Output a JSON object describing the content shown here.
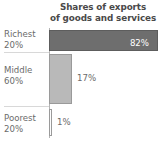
{
  "chart_data": {
    "type": "bar",
    "orientation": "horizontal",
    "title": "Shares of exports of goods and services",
    "title_lines": [
      "Shares of exports",
      "of goods and services"
    ],
    "xlabel": "",
    "ylabel": "",
    "grid": false,
    "legend": null,
    "xlim": [
      0,
      82
    ],
    "categories": [
      "Richest 20%",
      "Middle 60%",
      "Poorest 20%"
    ],
    "category_lines": [
      {
        "line1": "Richest",
        "line2": "20%"
      },
      {
        "line1": "Middle",
        "line2": "60%"
      },
      {
        "line1": "Poorest",
        "line2": "20%"
      }
    ],
    "values": [
      82,
      17,
      1
    ],
    "value_labels": [
      "82%",
      "17%",
      "1%"
    ],
    "bars": [
      {
        "category": "Richest 20%",
        "value": 82,
        "label": "82%",
        "label_position": "inside-right",
        "fill": "#6e6e6e",
        "stroke": "#5d5d5d",
        "label_color": "#ffffff"
      },
      {
        "category": "Middle 60%",
        "value": 17,
        "label": "17%",
        "label_position": "outside-right",
        "fill": "#b9b9b9",
        "stroke": "#9a9a9a",
        "label_color": "#6b6b6b"
      },
      {
        "category": "Poorest 20%",
        "value": 1,
        "label": "1%",
        "label_position": "outside-right",
        "fill": "#fdfdfd",
        "stroke": "#9a9a9a",
        "label_color": "#6b6b6b"
      }
    ],
    "colors": {
      "background": "#ffffff",
      "text": "#6b6b6b",
      "title_text": "#4a4a4a",
      "axis": "#b4b4b4",
      "separator": "#d8d8d8"
    }
  }
}
